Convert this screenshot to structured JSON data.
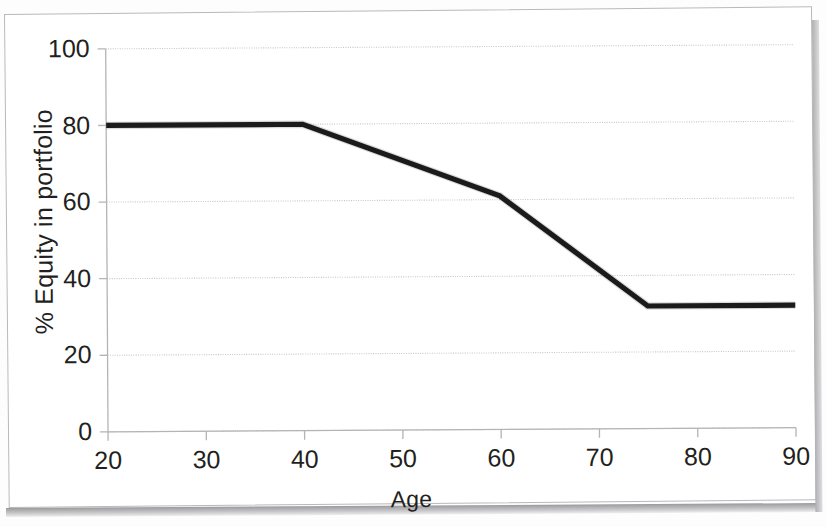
{
  "chart_data": {
    "type": "line",
    "title": "",
    "xlabel": "Age",
    "ylabel": "% Equity in portfolio",
    "xlim": [
      20,
      90
    ],
    "ylim": [
      0,
      100
    ],
    "xticks": [
      20,
      30,
      40,
      50,
      60,
      70,
      80,
      90
    ],
    "yticks": [
      0,
      20,
      40,
      60,
      80,
      100
    ],
    "xtick_labels": [
      "20",
      "30",
      "40",
      "50",
      "60",
      "70",
      "80",
      "90"
    ],
    "ytick_labels": [
      "0",
      "20",
      "40",
      "60",
      "80",
      "100"
    ],
    "grid": "horizontal",
    "legend": "none",
    "series": [
      {
        "name": "Equity glidepath",
        "color": "#1b1b1b",
        "x": [
          20,
          40,
          60,
          75,
          90
        ],
        "values": [
          80,
          80,
          61,
          32,
          32
        ]
      }
    ]
  },
  "figure": {
    "xlabel": "Age",
    "ylabel": "% Equity in portfolio"
  },
  "axis": {
    "y_labels": [
      "100",
      "80",
      "60",
      "40",
      "20",
      "0"
    ],
    "x_labels": [
      "20",
      "30",
      "40",
      "50",
      "60",
      "70",
      "80",
      "90"
    ]
  }
}
